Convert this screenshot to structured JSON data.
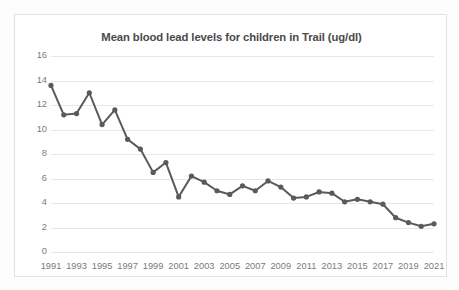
{
  "chart_data": {
    "type": "line",
    "title": "Mean blood lead levels for children in Trail (ug/dl)",
    "xlabel": "",
    "ylabel": "",
    "ylim": [
      0,
      16
    ],
    "y_ticks": [
      0,
      2,
      4,
      6,
      8,
      10,
      12,
      14,
      16
    ],
    "x_tick_labels": [
      "1991",
      "1993",
      "1995",
      "1997",
      "1999",
      "2001",
      "2003",
      "2005",
      "2007",
      "2009",
      "2011",
      "2013",
      "2015",
      "2017",
      "2019",
      "2021"
    ],
    "grid": "horizontal",
    "legend": "none",
    "marker": "circle",
    "series_color": "#5a5a5a",
    "categories": [
      1991,
      1992,
      1993,
      1994,
      1995,
      1996,
      1997,
      1998,
      1999,
      2000,
      2001,
      2002,
      2003,
      2004,
      2005,
      2006,
      2007,
      2008,
      2009,
      2010,
      2011,
      2012,
      2013,
      2014,
      2015,
      2016,
      2017,
      2018,
      2019,
      2020,
      2021
    ],
    "values": [
      13.6,
      11.2,
      11.3,
      13.0,
      10.4,
      11.6,
      9.2,
      8.4,
      6.5,
      7.3,
      4.5,
      6.2,
      5.7,
      5.0,
      4.7,
      5.4,
      5.0,
      5.8,
      5.3,
      4.4,
      4.5,
      4.9,
      4.8,
      4.1,
      4.3,
      4.1,
      3.9,
      2.8,
      2.4,
      2.1,
      2.3
    ],
    "series": [
      {
        "name": "Mean blood lead level (ug/dl)",
        "values": [
          13.6,
          11.2,
          11.3,
          13.0,
          10.4,
          11.6,
          9.2,
          8.4,
          6.5,
          7.3,
          4.5,
          6.2,
          5.7,
          5.0,
          4.7,
          5.4,
          5.0,
          5.8,
          5.3,
          4.4,
          4.5,
          4.9,
          4.8,
          4.1,
          4.3,
          4.1,
          3.9,
          2.8,
          2.4,
          2.1,
          2.3
        ]
      }
    ]
  },
  "colors": {
    "series": "#5a5a5a",
    "gridline": "#e8e8e8",
    "tick_text": "#7b7b7b",
    "title_text": "#4a4a4a",
    "frame_border": "#e2e2e2",
    "page_background": "#fdfdfd"
  }
}
